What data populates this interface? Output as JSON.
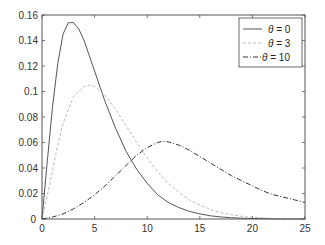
{
  "chart_data": {
    "type": "line",
    "title": "",
    "xlabel": "",
    "ylabel": "",
    "xlim": [
      0,
      25
    ],
    "ylim": [
      0,
      0.16
    ],
    "grid": false,
    "legend_position": "upper right",
    "x_ticks": [
      "0",
      "5",
      "10",
      "15",
      "20",
      "25"
    ],
    "y_ticks": [
      "0",
      "0.02",
      "0.04",
      "0.06",
      "0.08",
      "0.1",
      "0.12",
      "0.14",
      "0.16"
    ],
    "series": [
      {
        "name": "θ = 0",
        "style": "solid",
        "color": "#555555",
        "x": [
          0,
          0.5,
          1,
          1.5,
          2,
          2.5,
          3,
          3.5,
          4,
          4.5,
          5,
          6,
          7,
          8,
          9,
          10,
          11,
          12,
          13,
          14,
          15,
          16,
          17,
          18,
          19,
          20,
          22,
          25
        ],
        "y": [
          0,
          0.045,
          0.088,
          0.122,
          0.145,
          0.154,
          0.154,
          0.149,
          0.14,
          0.128,
          0.116,
          0.092,
          0.071,
          0.053,
          0.039,
          0.028,
          0.019,
          0.013,
          0.009,
          0.006,
          0.004,
          0.0025,
          0.0016,
          0.001,
          0.0006,
          0.0004,
          0.0001,
          0
        ]
      },
      {
        "name": "θ = 3",
        "style": "dashed",
        "color": "#bbbbbb",
        "x": [
          0,
          0.5,
          1,
          1.5,
          2,
          3,
          4,
          4.5,
          5,
          6,
          7,
          8,
          9,
          10,
          11,
          12,
          13,
          14,
          15,
          16,
          17,
          18,
          19,
          20,
          22,
          25
        ],
        "y": [
          0,
          0.018,
          0.038,
          0.058,
          0.075,
          0.096,
          0.104,
          0.105,
          0.104,
          0.097,
          0.086,
          0.073,
          0.06,
          0.048,
          0.037,
          0.028,
          0.021,
          0.015,
          0.011,
          0.0075,
          0.005,
          0.0033,
          0.0021,
          0.0013,
          0.0005,
          0.0001
        ]
      },
      {
        "name": "θ = 10",
        "style": "dashdot",
        "color": "#333333",
        "x": [
          0,
          1,
          2,
          3,
          4,
          5,
          6,
          7,
          8,
          9,
          10,
          11,
          11.5,
          12,
          13,
          14,
          15,
          16,
          17,
          18,
          19,
          20,
          21,
          22,
          23,
          24,
          25
        ],
        "y": [
          0,
          0.0015,
          0.004,
          0.008,
          0.013,
          0.019,
          0.026,
          0.034,
          0.042,
          0.05,
          0.056,
          0.06,
          0.061,
          0.0605,
          0.058,
          0.054,
          0.049,
          0.044,
          0.039,
          0.034,
          0.03,
          0.026,
          0.022,
          0.019,
          0.017,
          0.015,
          0.013
        ]
      }
    ]
  },
  "legend": {
    "entries": [
      {
        "label_var": "θ",
        "label_rest": " = 0"
      },
      {
        "label_var": "θ",
        "label_rest": " = 3"
      },
      {
        "label_var": "θ",
        "label_rest": " = 10"
      }
    ]
  }
}
